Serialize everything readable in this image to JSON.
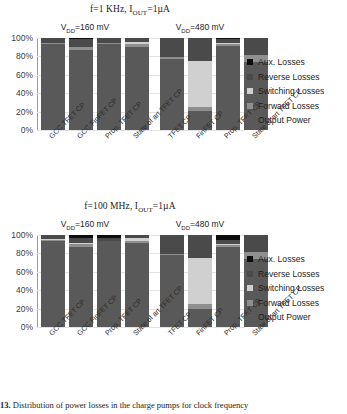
{
  "figure": {
    "caption_label": "13.",
    "caption_text": "Distribution of power losses in the charge pumps for clock frequency"
  },
  "legend": {
    "position": "right",
    "items": [
      {
        "label": "Aux. Losses",
        "color": "#0d0d0d"
      },
      {
        "label": "Reverse Losses",
        "color": "#4a4a4a"
      },
      {
        "label": "Switching Losses",
        "color": "#d0d0d0"
      },
      {
        "label": "Forward Losses",
        "color": "#8f8f8f"
      },
      {
        "label": "Output Power",
        "color": "#595959"
      }
    ]
  },
  "axis": {
    "yticks": [
      "100%",
      "80%",
      "60%",
      "40%",
      "20%",
      "0%"
    ],
    "ylim": [
      0,
      100
    ]
  },
  "chart_data": [
    {
      "type": "bar",
      "title": "f=1 KHz, I_OUT=1µA",
      "title_plain": "f=1 KHz, IOUT=1µA",
      "subtitle_left": "V_DD=160 mV",
      "subtitle_right": "V_DD=480 mV",
      "stacked": true,
      "ylabel": "",
      "xlabel": "",
      "ylim": [
        0,
        100
      ],
      "grid": true,
      "categories": [
        "GCC TFET CP",
        "GCC FinFET CP",
        "Prop. TFET CP",
        "State of art TFET CP",
        "",
        "TFET CP",
        "FinFET CP",
        "Prop. TFET CP",
        "State of art TFET CP"
      ],
      "series": [
        {
          "name": "Output Power",
          "color": "#595959",
          "values": [
            93,
            87,
            93,
            90,
            null,
            77,
            21,
            91,
            74
          ]
        },
        {
          "name": "Forward Losses",
          "color": "#8f8f8f",
          "values": [
            1.5,
            3,
            1.5,
            4,
            null,
            2,
            4,
            3,
            8
          ]
        },
        {
          "name": "Switching Losses",
          "color": "#d0d0d0",
          "values": [
            0,
            0.5,
            0,
            2,
            null,
            0,
            50,
            1,
            0
          ]
        },
        {
          "name": "Reverse Losses",
          "color": "#4a4a4a",
          "values": [
            5.5,
            8,
            5,
            4,
            null,
            21,
            25,
            4.5,
            18
          ]
        },
        {
          "name": "Aux. Losses",
          "color": "#0d0d0d",
          "values": [
            0,
            1.5,
            0.5,
            0,
            null,
            0,
            0,
            0.5,
            0
          ]
        }
      ]
    },
    {
      "type": "bar",
      "title": "f=100 MHz, I_OUT=1µA",
      "title_plain": "f=100 MHz, IOUT=1µA",
      "subtitle_left": "V_DD=160 mV",
      "subtitle_right": "V_DD=480 mV",
      "stacked": true,
      "ylabel": "",
      "xlabel": "",
      "ylim": [
        0,
        100
      ],
      "grid": true,
      "categories": [
        "GCC TFET CP",
        "GCC FinFET CP",
        "Prop. TFET CP",
        "State of art TFET CP",
        "",
        "TFET CP",
        "FinFET CP",
        "Prop. TFET CP",
        "State of art TFET CP"
      ],
      "series": [
        {
          "name": "Output Power",
          "color": "#595959",
          "values": [
            94,
            87,
            93,
            91,
            null,
            78,
            20,
            87,
            74
          ]
        },
        {
          "name": "Forward Losses",
          "color": "#8f8f8f",
          "values": [
            1,
            3,
            0.5,
            3,
            null,
            1,
            5,
            2,
            7
          ]
        },
        {
          "name": "Switching Losses",
          "color": "#d0d0d0",
          "values": [
            1,
            1,
            0.5,
            3,
            null,
            0,
            50,
            1,
            0
          ]
        },
        {
          "name": "Reverse Losses",
          "color": "#4a4a4a",
          "values": [
            4,
            6,
            3,
            3,
            null,
            21,
            25,
            5,
            19
          ]
        },
        {
          "name": "Aux. Losses",
          "color": "#0d0d0d",
          "values": [
            0,
            3,
            3,
            0,
            null,
            0,
            0,
            5,
            0
          ]
        }
      ]
    }
  ]
}
